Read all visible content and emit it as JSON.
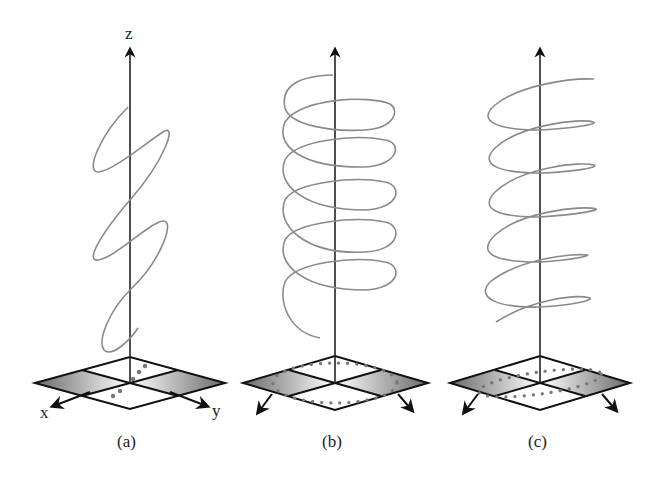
{
  "figure": {
    "panels": [
      {
        "id": "a",
        "caption": "(a)",
        "curve": "linear polarization (tilted planar wave)",
        "base_pattern": "diagonal line"
      },
      {
        "id": "b",
        "caption": "(b)",
        "curve": "circular polarization (helix)",
        "base_pattern": "circle"
      },
      {
        "id": "c",
        "caption": "(c)",
        "curve": "elliptical polarization (tilted helix)",
        "base_pattern": "tilted ellipse"
      }
    ],
    "axes": {
      "x": "x",
      "y": "y",
      "z": "z"
    }
  },
  "colors": {
    "axis": "#1a1a1a",
    "curve": "#8a8a8a",
    "dots": "#777777",
    "plane_shade": "#9a9a9a"
  }
}
